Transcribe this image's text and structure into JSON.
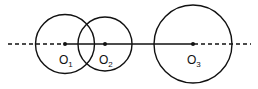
{
  "diagram": {
    "stroke_color": "#111111",
    "background": "#ffffff",
    "line": {
      "y": 44,
      "dash_left": [
        8,
        64
      ],
      "solid": [
        64,
        193
      ],
      "dash_right": [
        193,
        251
      ]
    },
    "circles": [
      {
        "id": "O1",
        "cx": 65,
        "cy": 44,
        "r": 29.5,
        "label": "O",
        "sub": "1",
        "label_x": 59,
        "label_y": 63
      },
      {
        "id": "O2",
        "cx": 105,
        "cy": 44,
        "r": 27,
        "label": "O",
        "sub": "2",
        "label_x": 99,
        "label_y": 63
      },
      {
        "id": "O3",
        "cx": 193,
        "cy": 44,
        "r": 39,
        "label": "O",
        "sub": "3",
        "label_x": 187,
        "label_y": 63
      }
    ]
  }
}
